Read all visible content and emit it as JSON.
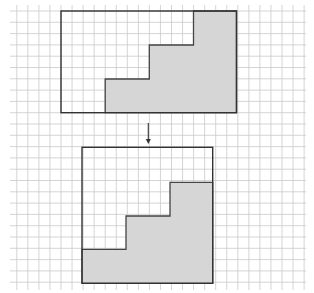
{
  "diagram": {
    "colors": {
      "grid": "#c9c9c9",
      "outline": "#333333",
      "shade": "#d6d6d6",
      "background": "#ffffff"
    },
    "grid": {
      "x_start": 16,
      "x_end": 306,
      "y_start": 5,
      "y_end": 290,
      "origin_x": 61,
      "origin_y": 11,
      "dx": 11.05,
      "dy": 11.3,
      "col_min": -4,
      "col_max": 22,
      "row_min": 0,
      "row_max": 24
    },
    "top_figure": {
      "box": {
        "x": 61,
        "y": 11,
        "w": 175.5,
        "h": 101.7,
        "cols": 16,
        "rows": 9
      },
      "shaded_polygon": [
        [
          193.5,
          11
        ],
        [
          236.5,
          11
        ],
        [
          236.5,
          112.7
        ],
        [
          105.2,
          112.7
        ],
        [
          105.2,
          79
        ],
        [
          149.3,
          79
        ],
        [
          149.3,
          45
        ],
        [
          193.5,
          45
        ]
      ]
    },
    "arrow": {
      "x": 148.3,
      "y1": 123,
      "y2": 144,
      "direction": "down"
    },
    "bottom_figure": {
      "box": {
        "x": 82,
        "y": 147.3,
        "w": 130.7,
        "h": 136,
        "cols": 12,
        "rows": 12
      },
      "shaded_polygon": [
        [
          170,
          182.3
        ],
        [
          212.7,
          182.3
        ],
        [
          212.7,
          283.3
        ],
        [
          82,
          283.3
        ],
        [
          82,
          249.3
        ],
        [
          126,
          249.3
        ],
        [
          126,
          216
        ],
        [
          170,
          216
        ]
      ]
    }
  }
}
